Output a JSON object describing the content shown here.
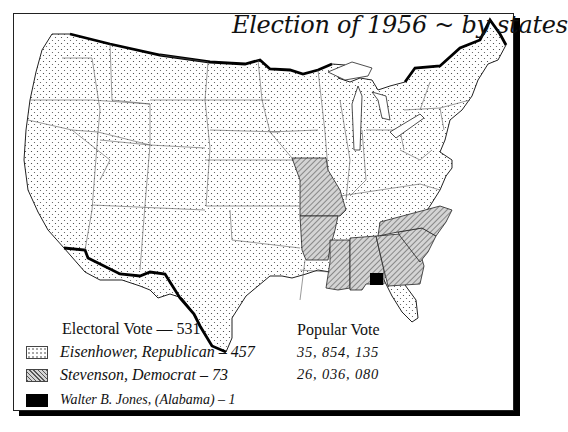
{
  "title": "Election of 1956 ~ by states",
  "legend": {
    "heading": "Electoral Vote  —  531",
    "items": [
      {
        "pattern": "dots",
        "label": "Eisenhower, Republican – 457"
      },
      {
        "pattern": "hatch",
        "label": "Stevenson, Democrat   –  73"
      },
      {
        "pattern": "solid",
        "label": "Walter B. Jones, (Alabama) – 1"
      }
    ]
  },
  "popular_vote": {
    "heading": "Popular Vote",
    "values": [
      "35, 854, 135",
      "26, 036, 080"
    ]
  },
  "map": {
    "candidates": {
      "eisenhower": {
        "party": "Republican",
        "electoral_votes": 457,
        "popular_vote": "35,854,135",
        "fill": "dots"
      },
      "stevenson": {
        "party": "Democrat",
        "electoral_votes": 73,
        "popular_vote": "26,036,080",
        "fill": "hatch"
      },
      "jones": {
        "note": "Alabama faithless elector",
        "electoral_votes": 1,
        "fill": "solid"
      }
    },
    "stevenson_states": [
      "Missouri",
      "Arkansas",
      "Mississippi",
      "Alabama",
      "Georgia",
      "South Carolina",
      "North Carolina"
    ],
    "colors": {
      "ink": "#111111",
      "hatch_fill": "#b8b8b8",
      "paper": "#ffffff"
    }
  }
}
